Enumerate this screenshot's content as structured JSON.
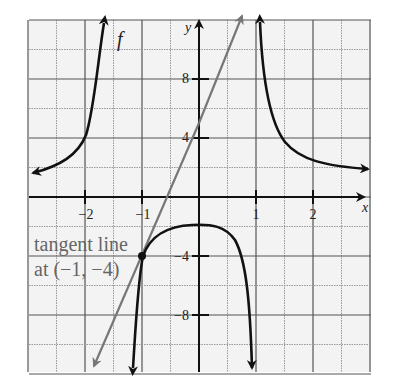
{
  "chart_data": {
    "type": "line",
    "title": "",
    "xlabel": "x",
    "ylabel": "y",
    "xlim": [
      -3,
      3
    ],
    "ylim": [
      -12,
      12
    ],
    "grid": true,
    "grid_minor_x": 0.5,
    "grid_minor_y": 2,
    "x_ticks": [
      -2,
      -1,
      1,
      2
    ],
    "x_tick_labels": [
      "−2",
      "−1",
      "1",
      "2"
    ],
    "y_ticks": [
      8,
      4,
      -4,
      -8
    ],
    "y_tick_labels": [
      "8",
      "4",
      "−4",
      "−8"
    ],
    "series": [
      {
        "name": "f",
        "label": "f",
        "color": "#111111",
        "description": "Rational function with vertical asymptotes near x = -1.3 and x = 0.9; left branch rises from y≈3 to +∞, middle branch is a downward cap with max ≈ -2 at x≈-0.1, right branch descends from +∞ to y≈2.",
        "branches": [
          {
            "x": [
              -3.0,
              -2.5,
              -2.0,
              -1.75,
              -1.6,
              -1.5,
              -1.45,
              -1.4
            ],
            "y": [
              2.9,
              3.5,
              4.6,
              5.8,
              7.5,
              9.2,
              10.6,
              12.5
            ]
          },
          {
            "x": [
              -1.15,
              -1.1,
              -1.05,
              -1.0,
              -0.8,
              -0.5,
              -0.2,
              0.0,
              0.2,
              0.4,
              0.55,
              0.65,
              0.72,
              0.78
            ],
            "y": [
              -12,
              -7.5,
              -5.4,
              -4.0,
              -2.8,
              -2.15,
              -2.0,
              -2.0,
              -2.3,
              -3.3,
              -5.0,
              -7.5,
              -9.8,
              -12
            ]
          },
          {
            "x": [
              0.95,
              1.0,
              1.1,
              1.25,
              1.5,
              1.75,
              2.0,
              2.5,
              2.9
            ],
            "y": [
              12.5,
              9.0,
              6.0,
              4.2,
              3.0,
              2.5,
              2.2,
              2.0,
              1.9
            ]
          }
        ]
      },
      {
        "name": "tangent line",
        "color": "#777777",
        "equation": "y = 9x + 5",
        "x": [
          -1.88,
          0.77
        ],
        "y": [
          -11.9,
          11.9
        ]
      }
    ],
    "points": [
      {
        "x": -1,
        "y": -4,
        "label": "(-1, -4)"
      }
    ],
    "annotations": [
      {
        "text": "tangent line",
        "line": 1
      },
      {
        "text": "at (−1, −4)",
        "line": 2
      },
      {
        "text": "f",
        "near": "left branch top"
      }
    ]
  },
  "labels": {
    "x_axis": "x",
    "y_axis": "y",
    "f_label": "f",
    "annot_line1": "tangent line",
    "annot_line2": "at (−1, −4)",
    "xt_m2": "−2",
    "xt_m1": "−1",
    "xt_1": "1",
    "xt_2": "2",
    "yt_8": "8",
    "yt_4": "4",
    "yt_m4": "−4",
    "yt_m8": "−8"
  },
  "colors": {
    "curve": "#111111",
    "tangent": "#777777",
    "grid_major": "#555555",
    "grid_minor": "#999999",
    "background": "#f3f3f3"
  }
}
